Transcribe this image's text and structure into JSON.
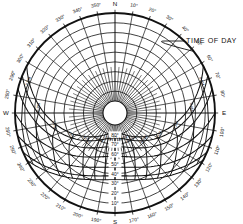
{
  "figure": {
    "title": "",
    "annotation": {
      "label": "TIME OF DAY",
      "x": 186,
      "y": 43
    },
    "background": "#ffffff",
    "ink": "#111111"
  },
  "chart_data": {
    "type": "scatter",
    "subtype": "sun-path-polar-diagram",
    "xlabel": "Azimuth",
    "ylabel": "Altitude",
    "grid": true,
    "legend_position": "none",
    "projection": "equidistant-polar",
    "center": {
      "cx": 115,
      "cy": 113
    },
    "outer_radius": 100,
    "zenith_hole_radius": 12,
    "azimuth": {
      "label": "Azimuth (degrees clockwise from North)",
      "range": [
        0,
        360
      ],
      "tick_step": 10,
      "cardinal_labels": [
        "N",
        "E",
        "S",
        "W"
      ],
      "ticks": [
        {
          "deg": 0,
          "label": "N"
        },
        {
          "deg": 10,
          "label": "10°"
        },
        {
          "deg": 20,
          "label": "20°"
        },
        {
          "deg": 30,
          "label": "30°"
        },
        {
          "deg": 40,
          "label": "40°"
        },
        {
          "deg": 50,
          "label": "50°"
        },
        {
          "deg": 60,
          "label": "60°"
        },
        {
          "deg": 70,
          "label": "70°"
        },
        {
          "deg": 80,
          "label": "80°"
        },
        {
          "deg": 90,
          "label": "E"
        },
        {
          "deg": 100,
          "label": "100°"
        },
        {
          "deg": 110,
          "label": "110°"
        },
        {
          "deg": 120,
          "label": "120°"
        },
        {
          "deg": 130,
          "label": "130°"
        },
        {
          "deg": 140,
          "label": "140°"
        },
        {
          "deg": 150,
          "label": "150°"
        },
        {
          "deg": 160,
          "label": "160°"
        },
        {
          "deg": 170,
          "label": "170°"
        },
        {
          "deg": 180,
          "label": "S"
        },
        {
          "deg": 190,
          "label": "190°"
        },
        {
          "deg": 200,
          "label": "200°"
        },
        {
          "deg": 210,
          "label": "210°"
        },
        {
          "deg": 220,
          "label": "220°"
        },
        {
          "deg": 230,
          "label": "230°"
        },
        {
          "deg": 240,
          "label": "240°"
        },
        {
          "deg": 250,
          "label": "250°"
        },
        {
          "deg": 260,
          "label": "260°"
        },
        {
          "deg": 270,
          "label": "W"
        },
        {
          "deg": 280,
          "label": "280°"
        },
        {
          "deg": 290,
          "label": "290°"
        },
        {
          "deg": 300,
          "label": "300°"
        },
        {
          "deg": 310,
          "label": "310°"
        },
        {
          "deg": 320,
          "label": "320°"
        },
        {
          "deg": 330,
          "label": "330°"
        },
        {
          "deg": 340,
          "label": "340°"
        },
        {
          "deg": 350,
          "label": "350°"
        }
      ]
    },
    "altitude": {
      "label": "Altitude (degrees above horizon)",
      "range": [
        0,
        90
      ],
      "tick_step": 10,
      "rings": [
        {
          "alt": 0,
          "label": "0°"
        },
        {
          "alt": 10,
          "label": "10°"
        },
        {
          "alt": 20,
          "label": "20°"
        },
        {
          "alt": 30,
          "label": "30°"
        },
        {
          "alt": 40,
          "label": "40°"
        },
        {
          "alt": 50,
          "label": "50°"
        },
        {
          "alt": 60,
          "label": "60°"
        },
        {
          "alt": 70,
          "label": "70°"
        },
        {
          "alt": 80,
          "label": "80°"
        }
      ],
      "ring_labels_shown": [
        "80°",
        "70°",
        "60°",
        "50°",
        "40°",
        "30°",
        "20°",
        "10°"
      ],
      "ring_label_azimuth_deg": 180
    },
    "sun_paths": {
      "label": "Sun path (declination) arcs",
      "count": 7,
      "arcs": [
        {
          "name": "Jun 21",
          "peak_altitude": 82,
          "sunrise_azimuth": 62,
          "sunset_azimuth": 298
        },
        {
          "name": "May/Jul",
          "peak_altitude": 77,
          "sunrise_azimuth": 68,
          "sunset_azimuth": 292
        },
        {
          "name": "Apr/Aug",
          "peak_altitude": 68,
          "sunrise_azimuth": 76,
          "sunset_azimuth": 284
        },
        {
          "name": "Mar/Sep",
          "peak_altitude": 58,
          "sunrise_azimuth": 90,
          "sunset_azimuth": 270
        },
        {
          "name": "Feb/Oct",
          "peak_altitude": 47,
          "sunrise_azimuth": 103,
          "sunset_azimuth": 257
        },
        {
          "name": "Jan/Nov",
          "peak_altitude": 38,
          "sunrise_azimuth": 113,
          "sunset_azimuth": 247
        },
        {
          "name": "Dec 21",
          "peak_altitude": 34,
          "sunrise_azimuth": 118,
          "sunset_azimuth": 242
        }
      ]
    },
    "hour_lines": {
      "label": "Time of day hour lines",
      "hours": [
        {
          "label": "5 AM"
        },
        {
          "label": "6 AM"
        },
        {
          "label": "7 AM"
        },
        {
          "label": "8 AM"
        },
        {
          "label": "9 AM"
        },
        {
          "label": "10 AM"
        },
        {
          "label": "11 AM"
        },
        {
          "label": "12"
        },
        {
          "label": "1 PM"
        },
        {
          "label": "2 PM"
        },
        {
          "label": "3 PM"
        },
        {
          "label": "4 PM"
        },
        {
          "label": "5 PM"
        },
        {
          "label": "6 PM"
        },
        {
          "label": "7 PM"
        }
      ]
    }
  }
}
